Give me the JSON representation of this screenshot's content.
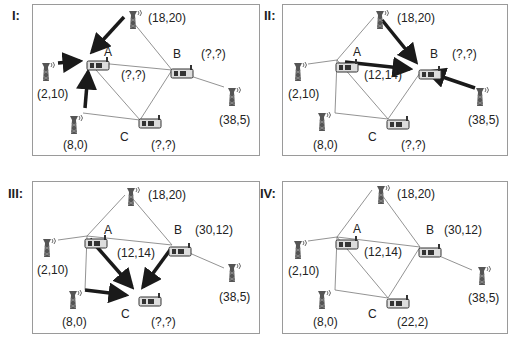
{
  "panels": [
    {
      "id": "I",
      "label": "I:",
      "towers": [
        {
          "name": "top",
          "coord": "(18,20)"
        },
        {
          "name": "left",
          "coord": "(2,10)"
        },
        {
          "name": "bottom",
          "coord": "(8,0)"
        },
        {
          "name": "right",
          "coord": "(38,5)"
        }
      ],
      "nodes": [
        {
          "name": "A",
          "coord": "(?,?)"
        },
        {
          "name": "B",
          "coord": "(?,?)"
        },
        {
          "name": "C",
          "coord": "(?,?)"
        }
      ],
      "bold_arrows": [
        "top->A",
        "left->A",
        "bottom->A"
      ]
    },
    {
      "id": "II",
      "label": "II:",
      "towers": [
        {
          "name": "top",
          "coord": "(18,20)"
        },
        {
          "name": "left",
          "coord": "(2,10)"
        },
        {
          "name": "bottom",
          "coord": "(8,0)"
        },
        {
          "name": "right",
          "coord": "(38,5)"
        }
      ],
      "nodes": [
        {
          "name": "A",
          "coord": "(12,14)"
        },
        {
          "name": "B",
          "coord": "(?,?)"
        },
        {
          "name": "C",
          "coord": "(?,?)"
        }
      ],
      "bold_arrows": [
        "top->B",
        "A->B",
        "right->B"
      ]
    },
    {
      "id": "III",
      "label": "III:",
      "towers": [
        {
          "name": "top",
          "coord": "(18,20)"
        },
        {
          "name": "left",
          "coord": "(2,10)"
        },
        {
          "name": "bottom",
          "coord": "(8,0)"
        },
        {
          "name": "right",
          "coord": "(38,5)"
        }
      ],
      "nodes": [
        {
          "name": "A",
          "coord": "(12,14)"
        },
        {
          "name": "B",
          "coord": "(30,12)"
        },
        {
          "name": "C",
          "coord": "(?,?)"
        }
      ],
      "bold_arrows": [
        "A->C",
        "B->C",
        "bottom->C"
      ]
    },
    {
      "id": "IV",
      "label": "IV:",
      "towers": [
        {
          "name": "top",
          "coord": "(18,20)"
        },
        {
          "name": "left",
          "coord": "(2,10)"
        },
        {
          "name": "bottom",
          "coord": "(8,0)"
        },
        {
          "name": "right",
          "coord": "(38,5)"
        }
      ],
      "nodes": [
        {
          "name": "A",
          "coord": "(12,14)"
        },
        {
          "name": "B",
          "coord": "(30,12)"
        },
        {
          "name": "C",
          "coord": "(22,2)"
        }
      ],
      "bold_arrows": []
    }
  ],
  "colors": {
    "line": "#777777",
    "bold": "#1a1a1a",
    "border": "#9a9a9a"
  }
}
